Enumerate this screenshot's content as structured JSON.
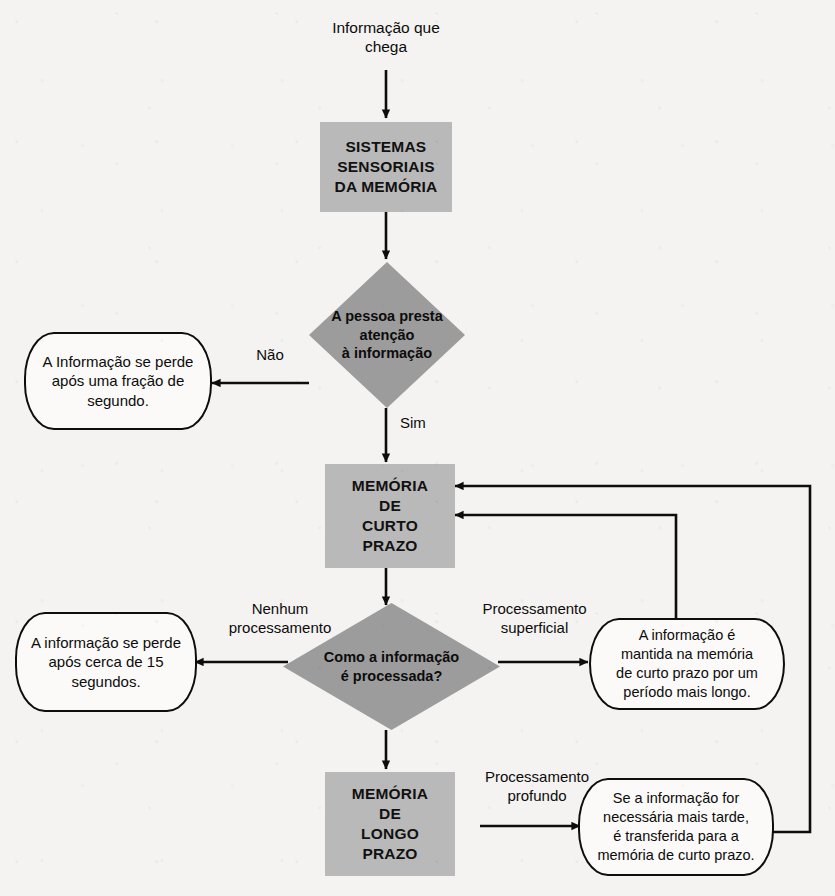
{
  "diagram": {
    "language": "pt-BR",
    "palette": {
      "background": "#f4f3f1",
      "process_fill": "#b9b9b9",
      "decision_fill": "#9c9c9c",
      "terminator_fill": "#fbfaf8",
      "stroke": "#0d0d0d",
      "text": "#0c0c0c"
    },
    "entry_label": "Informação que\nchega",
    "nodes": {
      "sensory": {
        "type": "process",
        "text_lines": [
          "SISTEMAS",
          "SENSORIAIS",
          "DA MEMÓRIA"
        ]
      },
      "attention": {
        "type": "decision",
        "text_lines": [
          "A pessoa presta",
          "atenção",
          "à informação"
        ]
      },
      "lost_fraction": {
        "type": "terminator",
        "text_lines": [
          "A Informação se perde",
          "após uma fração de",
          "segundo."
        ]
      },
      "short_term": {
        "type": "process",
        "text_lines": [
          "MEMÓRIA",
          "DE",
          "CURTO",
          "PRAZO"
        ]
      },
      "processing": {
        "type": "decision",
        "text_lines": [
          "Como a informação",
          "é processada?"
        ]
      },
      "lost_15s": {
        "type": "terminator",
        "text_lines": [
          "A informação se perde",
          "após cerca de 15",
          "segundos."
        ]
      },
      "kept_longer": {
        "type": "terminator",
        "text_lines": [
          "A informação é",
          "mantida na memória",
          "de curto prazo por um",
          "período mais longo."
        ]
      },
      "long_term": {
        "type": "process",
        "text_lines": [
          "MEMÓRIA",
          "DE",
          "LONGO",
          "PRAZO"
        ]
      },
      "transferred_back": {
        "type": "terminator",
        "text_lines": [
          "Se a informação for",
          "necessária mais tarde,",
          "é transferida para a",
          "memória de curto prazo."
        ]
      }
    },
    "edge_labels": {
      "no": "Não",
      "yes": "Sim",
      "no_processing": "Nenhum\nprocessamento",
      "shallow_processing": "Processamento\nsuperficial",
      "deep_processing": "Processamento\nprofundo"
    }
  }
}
